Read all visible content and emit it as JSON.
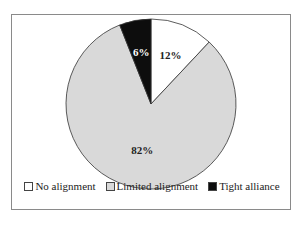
{
  "chart_data": {
    "type": "pie",
    "title": "",
    "categories": [
      "No alignment",
      "Limited alignment",
      "Tight alliance"
    ],
    "values": [
      12,
      82,
      6
    ],
    "labels": [
      "12%",
      "82%",
      "6%"
    ],
    "colors": [
      "#ffffff",
      "#d9d9d9",
      "#0d0d0d"
    ],
    "legend_position": "bottom"
  },
  "legend": [
    {
      "label": "No alignment",
      "color": "#ffffff"
    },
    {
      "label": "Limited alignment",
      "color": "#d9d9d9"
    },
    {
      "label": "Tight alliance",
      "color": "#0d0d0d"
    }
  ]
}
